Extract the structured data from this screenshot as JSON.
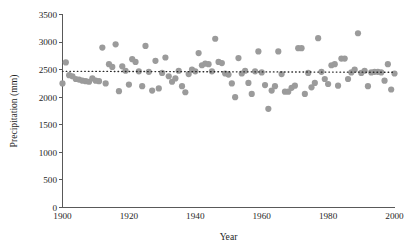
{
  "chart_data": {
    "type": "scatter",
    "title": "",
    "xlabel": "Year",
    "ylabel": "Precipitation (mm)",
    "xlim": [
      1900,
      2000
    ],
    "ylim": [
      0,
      3500
    ],
    "xticks": [
      1900,
      1920,
      1940,
      1960,
      1980,
      2000
    ],
    "yticks": [
      0,
      500,
      1000,
      1500,
      2000,
      2500,
      3000,
      3500
    ],
    "grid": false,
    "legend": null,
    "point_color": "#9b9b9b",
    "point_radius_px": 3.1,
    "trend": {
      "name": "mean precipitation reference line",
      "style": "dotted",
      "color": "#2b2b2b",
      "x": [
        1900,
        2000
      ],
      "y": [
        2470,
        2452
      ]
    },
    "series": [
      {
        "name": "Annual precipitation",
        "marker": "circle",
        "color": "#9b9b9b",
        "points": [
          [
            1900,
            2250
          ],
          [
            1901,
            2630
          ],
          [
            1902,
            2400
          ],
          [
            1903,
            2380
          ],
          [
            1904,
            2330
          ],
          [
            1905,
            2320
          ],
          [
            1906,
            2300
          ],
          [
            1907,
            2290
          ],
          [
            1908,
            2280
          ],
          [
            1909,
            2340
          ],
          [
            1910,
            2300
          ],
          [
            1911,
            2290
          ],
          [
            1912,
            2900
          ],
          [
            1913,
            2250
          ],
          [
            1914,
            2600
          ],
          [
            1915,
            2550
          ],
          [
            1916,
            2960
          ],
          [
            1917,
            2110
          ],
          [
            1918,
            2560
          ],
          [
            1919,
            2480
          ],
          [
            1920,
            2230
          ],
          [
            1921,
            2690
          ],
          [
            1922,
            2640
          ],
          [
            1923,
            2470
          ],
          [
            1924,
            2200
          ],
          [
            1925,
            2930
          ],
          [
            1926,
            2460
          ],
          [
            1927,
            2120
          ],
          [
            1928,
            2660
          ],
          [
            1929,
            2160
          ],
          [
            1930,
            2440
          ],
          [
            1931,
            2720
          ],
          [
            1932,
            2380
          ],
          [
            1933,
            2280
          ],
          [
            1934,
            2340
          ],
          [
            1935,
            2480
          ],
          [
            1936,
            2200
          ],
          [
            1937,
            2090
          ],
          [
            1938,
            2420
          ],
          [
            1939,
            2500
          ],
          [
            1940,
            2470
          ],
          [
            1941,
            2800
          ],
          [
            1942,
            2580
          ],
          [
            1943,
            2610
          ],
          [
            1944,
            2600
          ],
          [
            1945,
            2470
          ],
          [
            1946,
            3060
          ],
          [
            1947,
            2640
          ],
          [
            1948,
            2620
          ],
          [
            1949,
            2430
          ],
          [
            1950,
            2410
          ],
          [
            1951,
            2250
          ],
          [
            1952,
            2000
          ],
          [
            1953,
            2710
          ],
          [
            1954,
            2430
          ],
          [
            1955,
            2480
          ],
          [
            1956,
            2260
          ],
          [
            1957,
            2060
          ],
          [
            1958,
            2470
          ],
          [
            1959,
            2830
          ],
          [
            1960,
            2450
          ],
          [
            1961,
            2220
          ],
          [
            1962,
            1790
          ],
          [
            1963,
            2120
          ],
          [
            1964,
            2200
          ],
          [
            1965,
            2830
          ],
          [
            1966,
            2420
          ],
          [
            1967,
            2100
          ],
          [
            1968,
            2100
          ],
          [
            1969,
            2170
          ],
          [
            1970,
            2210
          ],
          [
            1971,
            2890
          ],
          [
            1972,
            2890
          ],
          [
            1973,
            2060
          ],
          [
            1974,
            2440
          ],
          [
            1975,
            2180
          ],
          [
            1976,
            2260
          ],
          [
            1977,
            3070
          ],
          [
            1978,
            2460
          ],
          [
            1979,
            2330
          ],
          [
            1980,
            2240
          ],
          [
            1981,
            2580
          ],
          [
            1982,
            2600
          ],
          [
            1983,
            2210
          ],
          [
            1984,
            2700
          ],
          [
            1985,
            2700
          ],
          [
            1986,
            2330
          ],
          [
            1987,
            2450
          ],
          [
            1988,
            2500
          ],
          [
            1989,
            3160
          ],
          [
            1990,
            2440
          ],
          [
            1991,
            2480
          ],
          [
            1992,
            2200
          ],
          [
            1993,
            2450
          ],
          [
            1994,
            2460
          ],
          [
            1995,
            2460
          ],
          [
            1996,
            2450
          ],
          [
            1997,
            2300
          ],
          [
            1998,
            2600
          ],
          [
            1999,
            2140
          ],
          [
            2000,
            2430
          ]
        ]
      }
    ]
  }
}
